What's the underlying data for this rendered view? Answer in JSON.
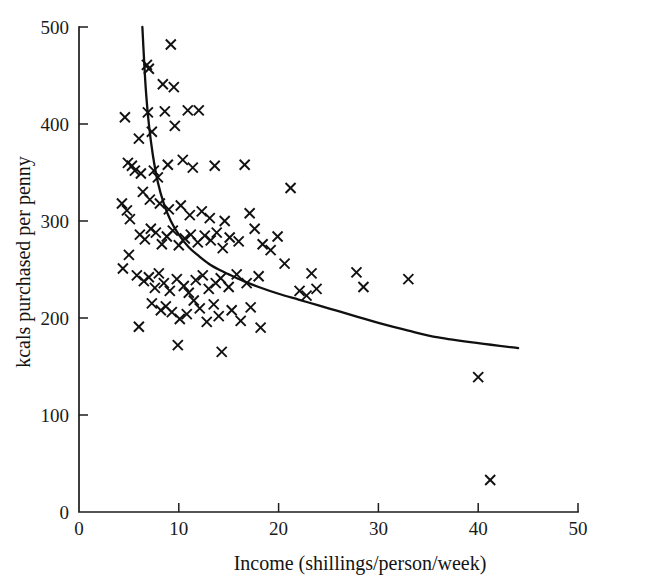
{
  "chart_data": {
    "type": "scatter",
    "title": "",
    "xlabel": "Income (shillings/person/week)",
    "ylabel": "kcals purchased per penny",
    "xlim": [
      0,
      50
    ],
    "ylim": [
      0,
      500
    ],
    "xticks": [
      0,
      10,
      20,
      30,
      40,
      50
    ],
    "yticks": [
      0,
      100,
      200,
      300,
      400,
      500
    ],
    "xtick_labels": [
      "0",
      "10",
      "20",
      "30",
      "40",
      "50"
    ],
    "ytick_labels": [
      "0",
      "100",
      "200",
      "300",
      "400",
      "500"
    ],
    "grid": false,
    "legend": null,
    "marker": "x",
    "marker_color": "#111111",
    "series": [
      {
        "name": "households",
        "marker": "x",
        "points": [
          [
            6.8,
            461
          ],
          [
            7.0,
            457
          ],
          [
            9.2,
            482
          ],
          [
            8.4,
            441
          ],
          [
            9.5,
            438
          ],
          [
            4.6,
            407
          ],
          [
            6.9,
            412
          ],
          [
            8.6,
            413
          ],
          [
            10.9,
            414
          ],
          [
            12.0,
            414
          ],
          [
            9.6,
            398
          ],
          [
            7.3,
            392
          ],
          [
            6.0,
            385
          ],
          [
            4.9,
            360
          ],
          [
            5.3,
            357
          ],
          [
            5.6,
            352
          ],
          [
            6.2,
            349
          ],
          [
            7.5,
            352
          ],
          [
            8.9,
            358
          ],
          [
            10.4,
            363
          ],
          [
            11.4,
            355
          ],
          [
            13.6,
            357
          ],
          [
            16.6,
            358
          ],
          [
            7.9,
            345
          ],
          [
            4.3,
            318
          ],
          [
            4.8,
            311
          ],
          [
            5.1,
            302
          ],
          [
            6.4,
            330
          ],
          [
            7.1,
            322
          ],
          [
            8.1,
            318
          ],
          [
            9.0,
            312
          ],
          [
            10.2,
            316
          ],
          [
            11.1,
            306
          ],
          [
            12.3,
            310
          ],
          [
            13.1,
            303
          ],
          [
            14.6,
            300
          ],
          [
            17.1,
            308
          ],
          [
            21.2,
            334
          ],
          [
            4.4,
            251
          ],
          [
            5.0,
            265
          ],
          [
            6.1,
            286
          ],
          [
            6.6,
            281
          ],
          [
            7.2,
            292
          ],
          [
            7.7,
            288
          ],
          [
            8.3,
            276
          ],
          [
            8.8,
            284
          ],
          [
            9.4,
            290
          ],
          [
            10.0,
            275
          ],
          [
            10.6,
            282
          ],
          [
            11.2,
            286
          ],
          [
            11.9,
            278
          ],
          [
            12.6,
            285
          ],
          [
            13.2,
            280
          ],
          [
            13.8,
            288
          ],
          [
            14.4,
            272
          ],
          [
            15.1,
            283
          ],
          [
            16.0,
            279
          ],
          [
            17.6,
            292
          ],
          [
            18.4,
            276
          ],
          [
            19.9,
            284
          ],
          [
            5.8,
            244
          ],
          [
            6.5,
            238
          ],
          [
            7.0,
            242
          ],
          [
            7.6,
            231
          ],
          [
            8.0,
            246
          ],
          [
            8.5,
            236
          ],
          [
            9.1,
            228
          ],
          [
            9.8,
            240
          ],
          [
            10.5,
            233
          ],
          [
            11.0,
            226
          ],
          [
            11.7,
            239
          ],
          [
            12.4,
            244
          ],
          [
            13.0,
            230
          ],
          [
            13.7,
            236
          ],
          [
            14.2,
            241
          ],
          [
            15.0,
            232
          ],
          [
            15.8,
            245
          ],
          [
            16.8,
            236
          ],
          [
            18.0,
            243
          ],
          [
            19.2,
            270
          ],
          [
            20.6,
            256
          ],
          [
            22.1,
            228
          ],
          [
            22.8,
            223
          ],
          [
            23.3,
            246
          ],
          [
            23.8,
            230
          ],
          [
            27.8,
            247
          ],
          [
            28.5,
            232
          ],
          [
            33.0,
            240
          ],
          [
            6.0,
            191
          ],
          [
            7.3,
            215
          ],
          [
            8.2,
            208
          ],
          [
            8.7,
            212
          ],
          [
            9.3,
            206
          ],
          [
            10.1,
            199
          ],
          [
            10.8,
            204
          ],
          [
            11.5,
            218
          ],
          [
            12.1,
            210
          ],
          [
            12.8,
            196
          ],
          [
            13.5,
            214
          ],
          [
            14.0,
            202
          ],
          [
            15.3,
            208
          ],
          [
            16.2,
            197
          ],
          [
            17.2,
            211
          ],
          [
            18.2,
            190
          ],
          [
            9.9,
            172
          ],
          [
            14.3,
            165
          ],
          [
            40.0,
            139
          ],
          [
            41.2,
            33
          ]
        ]
      }
    ],
    "fit_curve": {
      "name": "fitted curve",
      "equation_points": [
        [
          6.35,
          500
        ],
        [
          6.5,
          470
        ],
        [
          6.7,
          435
        ],
        [
          7.0,
          400
        ],
        [
          7.4,
          368
        ],
        [
          7.9,
          340
        ],
        [
          8.5,
          318
        ],
        [
          9.2,
          300
        ],
        [
          10.0,
          286
        ],
        [
          11.0,
          273
        ],
        [
          12.0,
          264
        ],
        [
          13.0,
          256
        ],
        [
          14.0,
          250
        ],
        [
          15.0,
          245
        ],
        [
          16.5,
          238
        ],
        [
          18.0,
          232
        ],
        [
          20.0,
          225
        ],
        [
          22.0,
          219
        ],
        [
          24.0,
          213
        ],
        [
          26.0,
          207
        ],
        [
          28.0,
          201
        ],
        [
          30.0,
          195
        ],
        [
          33.0,
          187
        ],
        [
          36.0,
          180
        ],
        [
          40.0,
          174
        ],
        [
          44.0,
          169
        ]
      ]
    }
  }
}
